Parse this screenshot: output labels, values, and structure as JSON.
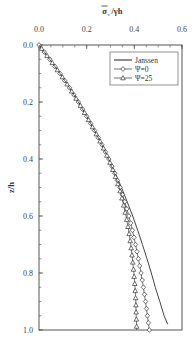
{
  "chart_data": {
    "type": "line",
    "title": "",
    "xlabel": "σ̄ᵥ/γh",
    "ylabel": "z/h",
    "x_axis_position": "top",
    "y_axis_inverted": true,
    "xlim": [
      0.0,
      0.6
    ],
    "ylim": [
      0.0,
      1.0
    ],
    "x_ticks": [
      "0.0",
      "0.2",
      "0.4",
      "0.6"
    ],
    "y_ticks": [
      "0.0",
      "0.2",
      "0.4",
      "0.6",
      "0.8",
      "1.0"
    ],
    "grid": false,
    "legend_position": "upper right",
    "legend": [
      "Janssen",
      "Ψ=0",
      "Ψ=25"
    ],
    "series": [
      {
        "name": "Janssen",
        "marker": "none",
        "z": [
          0.0,
          0.05,
          0.1,
          0.15,
          0.2,
          0.25,
          0.3,
          0.35,
          0.4,
          0.45,
          0.5,
          0.55,
          0.6,
          0.65,
          0.7,
          0.75,
          0.8,
          0.85,
          0.9,
          0.95,
          0.98
        ],
        "values": [
          0.0,
          0.045,
          0.088,
          0.128,
          0.165,
          0.2,
          0.233,
          0.264,
          0.293,
          0.32,
          0.346,
          0.37,
          0.393,
          0.414,
          0.434,
          0.453,
          0.471,
          0.488,
          0.507,
          0.525,
          0.54
        ]
      },
      {
        "name": "Ψ=0",
        "marker": "diamond",
        "z": [
          0.0,
          0.05,
          0.1,
          0.15,
          0.2,
          0.25,
          0.3,
          0.35,
          0.4,
          0.45,
          0.5,
          0.55,
          0.6,
          0.65,
          0.7,
          0.75,
          0.8,
          0.85,
          0.9,
          0.95,
          1.0
        ],
        "values": [
          0.0,
          0.045,
          0.088,
          0.128,
          0.165,
          0.2,
          0.233,
          0.264,
          0.293,
          0.318,
          0.34,
          0.36,
          0.377,
          0.392,
          0.405,
          0.417,
          0.428,
          0.438,
          0.447,
          0.455,
          0.463
        ]
      },
      {
        "name": "Ψ=25",
        "marker": "triangle",
        "z": [
          0.0,
          0.05,
          0.1,
          0.15,
          0.2,
          0.25,
          0.3,
          0.35,
          0.4,
          0.45,
          0.5,
          0.55,
          0.6,
          0.65,
          0.7,
          0.75,
          0.8,
          0.85,
          0.9,
          0.95,
          1.0
        ],
        "values": [
          0.0,
          0.045,
          0.088,
          0.128,
          0.165,
          0.2,
          0.233,
          0.264,
          0.292,
          0.316,
          0.336,
          0.352,
          0.365,
          0.376,
          0.385,
          0.392,
          0.398,
          0.403,
          0.406,
          0.408,
          0.41
        ]
      }
    ]
  },
  "axes": {
    "x_title_main": "σ",
    "x_title_sub": "v",
    "x_title_rest": "/γh",
    "y_title": "z/h"
  }
}
